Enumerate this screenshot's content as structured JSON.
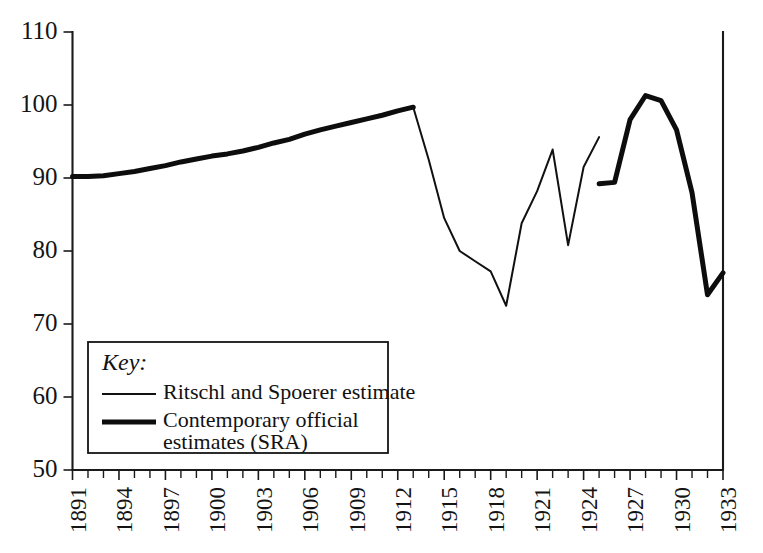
{
  "chart_data": {
    "type": "line",
    "title": "",
    "subtitle": "",
    "xlabel": "",
    "ylabel": "",
    "xlim": [
      1891,
      1933
    ],
    "ylim": [
      50,
      110
    ],
    "grid": false,
    "legend_position": "inside-lower-left",
    "y_ticks": [
      50,
      60,
      70,
      80,
      90,
      100,
      110
    ],
    "y_tick_labels": [
      "50",
      "60",
      "70",
      "80",
      "90",
      "100",
      "110"
    ],
    "x_ticks": [
      1891,
      1894,
      1897,
      1900,
      1903,
      1906,
      1909,
      1912,
      1915,
      1918,
      1921,
      1924,
      1927,
      1930,
      1933
    ],
    "x_tick_labels": [
      "1891",
      "1894",
      "1897",
      "1900",
      "1903",
      "1906",
      "1909",
      "1912",
      "1915",
      "1918",
      "1921",
      "1924",
      "1927",
      "1930",
      "1933"
    ],
    "x_minor_tick_interval": 1,
    "series": [
      {
        "name": "Contemporary official estimates (SRA)",
        "style": "thick",
        "segments": [
          {
            "x": [
              1891,
              1892,
              1893,
              1894,
              1895,
              1896,
              1897,
              1898,
              1899,
              1900,
              1901,
              1902,
              1903,
              1904,
              1905,
              1906,
              1907,
              1908,
              1909,
              1910,
              1911,
              1912,
              1913
            ],
            "y": [
              90.2,
              90.2,
              90.3,
              90.6,
              90.9,
              91.3,
              91.7,
              92.2,
              92.6,
              93.0,
              93.3,
              93.7,
              94.2,
              94.8,
              95.3,
              96.0,
              96.6,
              97.1,
              97.6,
              98.1,
              98.6,
              99.2,
              99.7
            ]
          },
          {
            "x": [
              1925,
              1926,
              1927,
              1928,
              1929,
              1930,
              1931,
              1932,
              1933
            ],
            "y": [
              89.2,
              89.4,
              98.0,
              101.3,
              100.6,
              96.6,
              88.0,
              74.0,
              77.0
            ]
          }
        ]
      },
      {
        "name": "Ritschl and Spoerer estimate",
        "style": "thin",
        "segments": [
          {
            "x": [
              1913,
              1914,
              1915,
              1916,
              1917,
              1918,
              1919,
              1920,
              1921,
              1922,
              1923,
              1924,
              1925
            ],
            "y": [
              99.7,
              92.5,
              84.5,
              80.0,
              78.6,
              77.2,
              72.5,
              83.8,
              88.2,
              93.9,
              80.8,
              91.5,
              95.6
            ]
          }
        ]
      }
    ]
  },
  "legend": {
    "title": "Key:",
    "entries": [
      {
        "label": "Ritschl and Spoerer estimate",
        "style": "thin"
      },
      {
        "label": "Contemporary official",
        "label_line2": "estimates (SRA)",
        "style": "thick"
      }
    ]
  },
  "colors": {
    "ink": "#111111",
    "background": "#ffffff"
  }
}
